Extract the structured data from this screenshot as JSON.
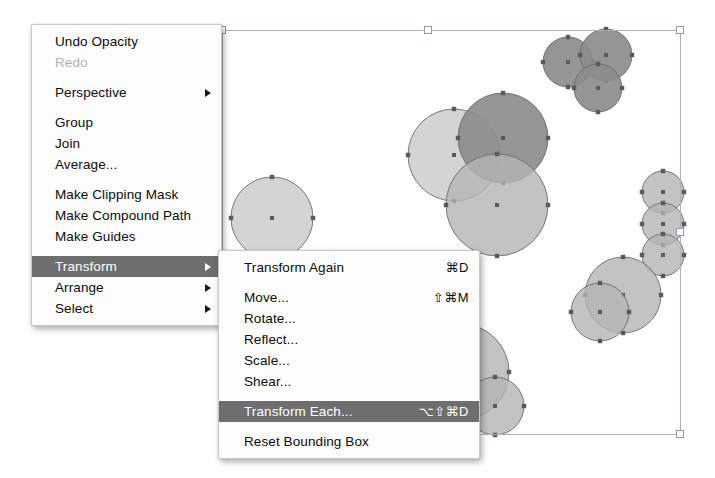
{
  "app": {
    "name": "Adobe Illustrator",
    "context": "object-menu-transform-submenu"
  },
  "main_menu": {
    "name": "Object menu",
    "items": [
      {
        "label": "Undo Opacity",
        "shortcut": "",
        "state": "enabled",
        "submenu": false
      },
      {
        "label": "Redo",
        "shortcut": "",
        "state": "disabled",
        "submenu": false
      },
      {
        "label": "Perspective",
        "shortcut": "",
        "state": "enabled",
        "submenu": true
      },
      {
        "label": "Group",
        "shortcut": "",
        "state": "enabled",
        "submenu": false
      },
      {
        "label": "Join",
        "shortcut": "",
        "state": "enabled",
        "submenu": false
      },
      {
        "label": "Average...",
        "shortcut": "",
        "state": "enabled",
        "submenu": false
      },
      {
        "label": "Make Clipping Mask",
        "shortcut": "",
        "state": "enabled",
        "submenu": false
      },
      {
        "label": "Make Compound Path",
        "shortcut": "",
        "state": "enabled",
        "submenu": false
      },
      {
        "label": "Make Guides",
        "shortcut": "",
        "state": "enabled",
        "submenu": false
      },
      {
        "label": "Transform",
        "shortcut": "",
        "state": "selected",
        "submenu": true
      },
      {
        "label": "Arrange",
        "shortcut": "",
        "state": "enabled",
        "submenu": true
      },
      {
        "label": "Select",
        "shortcut": "",
        "state": "enabled",
        "submenu": true
      }
    ]
  },
  "sub_menu": {
    "name": "Transform submenu",
    "items": [
      {
        "label": "Transform Again",
        "shortcut": "⌘D",
        "state": "enabled"
      },
      {
        "label": "Move...",
        "shortcut": "⇧⌘M",
        "state": "enabled"
      },
      {
        "label": "Rotate...",
        "shortcut": "",
        "state": "enabled"
      },
      {
        "label": "Reflect...",
        "shortcut": "",
        "state": "enabled"
      },
      {
        "label": "Scale...",
        "shortcut": "",
        "state": "enabled"
      },
      {
        "label": "Shear...",
        "shortcut": "",
        "state": "enabled"
      },
      {
        "label": "Transform Each...",
        "shortcut": "⌥⇧⌘D",
        "state": "selected"
      },
      {
        "label": "Reset Bounding Box",
        "shortcut": "",
        "state": "enabled"
      }
    ]
  },
  "colors": {
    "menu_background": "#fdfdfd",
    "menu_border": "#c9c9c9",
    "highlight_background": "#6e6e6e",
    "highlight_text": "#ffffff",
    "text": "#0c0c0c",
    "disabled_text": "#b2b2b2",
    "shape_light": "#c9c9c9",
    "shape_medium": "#b4b4b4",
    "shape_dark": "#8c8c8c",
    "shape_stroke": "#6b6b6b",
    "anchor_point": "#5a5a5a",
    "selection_line": "#a8b4c4",
    "handle_fill": "#ffffff"
  },
  "selection": {
    "name": "bounding-box",
    "x": 222,
    "y": 30,
    "width": 458,
    "height": 404,
    "handles": [
      {
        "x": 222,
        "y": 30
      },
      {
        "x": 428,
        "y": 30
      },
      {
        "x": 680,
        "y": 30
      },
      {
        "x": 680,
        "y": 232
      },
      {
        "x": 222,
        "y": 434
      },
      {
        "x": 428,
        "y": 434
      },
      {
        "x": 680,
        "y": 434
      }
    ]
  },
  "artwork": {
    "name": "circle-objects",
    "circles": [
      {
        "cx": 272,
        "cy": 218,
        "r": 41,
        "tone": "light"
      },
      {
        "cx": 454,
        "cy": 155,
        "r": 46,
        "tone": "light"
      },
      {
        "cx": 503,
        "cy": 138,
        "r": 45,
        "tone": "dark"
      },
      {
        "cx": 497,
        "cy": 205,
        "r": 51,
        "tone": "medium"
      },
      {
        "cx": 568,
        "cy": 62,
        "r": 25,
        "tone": "dark"
      },
      {
        "cx": 606,
        "cy": 55,
        "r": 26,
        "tone": "dark"
      },
      {
        "cx": 598,
        "cy": 88,
        "r": 24,
        "tone": "dark"
      },
      {
        "cx": 663,
        "cy": 192,
        "r": 21,
        "tone": "medium"
      },
      {
        "cx": 663,
        "cy": 224,
        "r": 21,
        "tone": "medium"
      },
      {
        "cx": 663,
        "cy": 255,
        "r": 21,
        "tone": "medium"
      },
      {
        "cx": 623,
        "cy": 295,
        "r": 38,
        "tone": "medium"
      },
      {
        "cx": 600,
        "cy": 312,
        "r": 29,
        "tone": "medium"
      },
      {
        "cx": 461,
        "cy": 372,
        "r": 48,
        "tone": "medium"
      },
      {
        "cx": 495,
        "cy": 406,
        "r": 29,
        "tone": "medium"
      }
    ]
  }
}
